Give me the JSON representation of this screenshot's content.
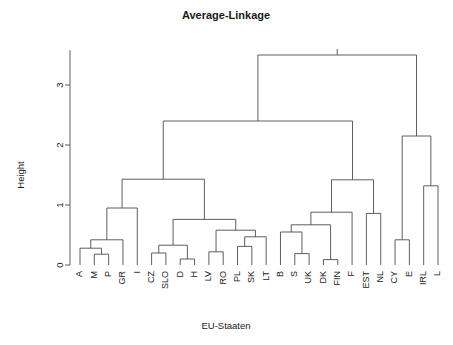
{
  "chart_data": {
    "type": "dendrogram",
    "title": "Average-Linkage",
    "xlabel": "EU-Staaten",
    "ylabel": "Height",
    "ylim": [
      0,
      3.6
    ],
    "yticks": [
      0,
      1,
      2,
      3
    ],
    "ytick_labels": [
      "0",
      "1",
      "2",
      "3"
    ],
    "grid": false,
    "legend": null,
    "linkage_method": "average",
    "leaves": [
      "A",
      "M",
      "P",
      "GR",
      "I",
      "CZ",
      "SLO",
      "D",
      "H",
      "LV",
      "RO",
      "PL",
      "SK",
      "LT",
      "B",
      "S",
      "UK",
      "DK",
      "FIN",
      "F",
      "EST",
      "NL",
      "CY",
      "E",
      "IRL",
      "L"
    ],
    "leaf_count": 26,
    "merges": [
      {
        "id": "n1",
        "left": "M",
        "right": "P",
        "height": 0.18
      },
      {
        "id": "n2",
        "left": "A",
        "right": "n1",
        "height": 0.28
      },
      {
        "id": "n3",
        "left": "n2",
        "right": "GR",
        "height": 0.42
      },
      {
        "id": "n4",
        "left": "n3",
        "right": "I",
        "height": 0.95
      },
      {
        "id": "n5",
        "left": "CZ",
        "right": "SLO",
        "height": 0.2
      },
      {
        "id": "n6",
        "left": "D",
        "right": "H",
        "height": 0.1
      },
      {
        "id": "n7",
        "left": "n5",
        "right": "n6",
        "height": 0.33
      },
      {
        "id": "n8",
        "left": "LV",
        "right": "RO",
        "height": 0.22
      },
      {
        "id": "n9",
        "left": "PL",
        "right": "SK",
        "height": 0.31
      },
      {
        "id": "n10",
        "left": "n9",
        "right": "LT",
        "height": 0.47
      },
      {
        "id": "n11",
        "left": "n8",
        "right": "n10",
        "height": 0.58
      },
      {
        "id": "n12",
        "left": "n7",
        "right": "n11",
        "height": 0.76
      },
      {
        "id": "n13",
        "left": "n4",
        "right": "n12",
        "height": 1.43
      },
      {
        "id": "n14",
        "left": "S",
        "right": "UK",
        "height": 0.19
      },
      {
        "id": "n15",
        "left": "B",
        "right": "n14",
        "height": 0.55
      },
      {
        "id": "n16",
        "left": "DK",
        "right": "FIN",
        "height": 0.09
      },
      {
        "id": "n17",
        "left": "n15",
        "right": "n16",
        "height": 0.67
      },
      {
        "id": "n18",
        "left": "n17",
        "right": "F",
        "height": 0.88
      },
      {
        "id": "n19",
        "left": "EST",
        "right": "NL",
        "height": 0.86
      },
      {
        "id": "n20",
        "left": "n18",
        "right": "n19",
        "height": 1.42
      },
      {
        "id": "n21",
        "left": "n13",
        "right": "n20",
        "height": 2.4
      },
      {
        "id": "n22",
        "left": "CY",
        "right": "E",
        "height": 0.42
      },
      {
        "id": "n23",
        "left": "IRL",
        "right": "L",
        "height": 1.32
      },
      {
        "id": "n24",
        "left": "n22",
        "right": "n23",
        "height": 2.15
      },
      {
        "id": "n25",
        "left": "n21",
        "right": "n24",
        "height": 3.5
      }
    ]
  },
  "axes": {
    "y_axis_label": "Height",
    "x_axis_label": "EU-Staaten",
    "tick_labels": [
      "0",
      "1",
      "2",
      "3"
    ]
  },
  "header": {
    "title": "Average-Linkage"
  },
  "colors": {
    "line": "#4d4d4d",
    "text": "#1a1a1a",
    "background": "#ffffff"
  }
}
